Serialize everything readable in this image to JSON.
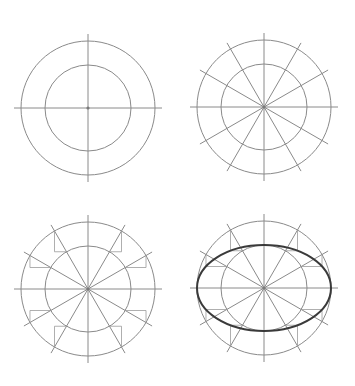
{
  "diagram": {
    "title": "",
    "description_visible_text": "",
    "colors": {
      "background": "#ffffff",
      "line": "#8a8a8a",
      "construction": "#9a9a9a",
      "ellipse": "#3a3a3a"
    },
    "panels": [
      {
        "id": "step-1",
        "center": [
          88,
          108
        ],
        "outer_radius": 67,
        "inner_radius": 43,
        "axis_extension": 7,
        "spokes": 2,
        "show_construction": false,
        "show_ellipse": false
      },
      {
        "id": "step-2",
        "center": [
          264,
          107
        ],
        "outer_radius": 67,
        "inner_radius": 43,
        "axis_extension": 7,
        "spokes": 6,
        "show_construction": false,
        "show_ellipse": false
      },
      {
        "id": "step-3",
        "center": [
          88,
          289
        ],
        "outer_radius": 67,
        "inner_radius": 43,
        "axis_extension": 7,
        "spokes": 6,
        "show_construction": true,
        "show_ellipse": false
      },
      {
        "id": "step-4",
        "center": [
          264,
          288
        ],
        "outer_radius": 67,
        "inner_radius": 43,
        "axis_extension": 7,
        "spokes": 6,
        "show_construction": true,
        "show_ellipse": true
      }
    ]
  }
}
